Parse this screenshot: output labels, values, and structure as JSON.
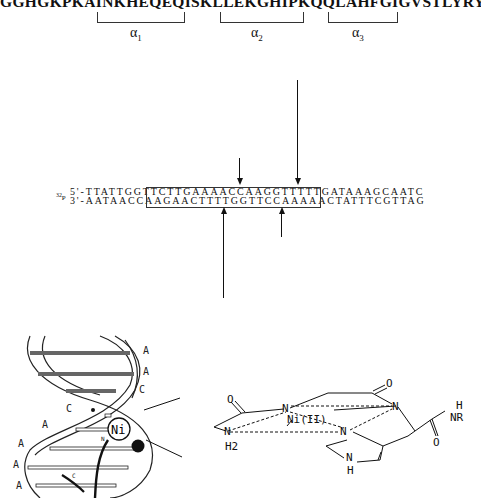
{
  "protein": {
    "sequence": "GGHGKPKAINKHEQEQISKLLEKGHIPKQQLAHFGIGVSTLYRYFPASSIKKRMN",
    "helices": [
      {
        "symbol": "α",
        "index": "1"
      },
      {
        "symbol": "α",
        "index": "2"
      },
      {
        "symbol": "α",
        "index": "3"
      }
    ]
  },
  "dna": {
    "label": "32P",
    "top_prefix": "5'-",
    "top_left": "TTATTGG",
    "top_boxed": "TTCTTGAAAACCAAGGTTTTTGATAA",
    "top_right": "AGCAATC",
    "bottom_prefix": "3'-",
    "bottom_left": "AATAACC",
    "bottom_boxed": "AAGAACTTTTGGTTCCAAAAACTATT",
    "bottom_right": "TCGTTAG"
  },
  "helix_diagram": {
    "bases_right": [
      "A",
      "A",
      "C"
    ],
    "bases_left": [
      "C",
      "A",
      "A",
      "A",
      "A"
    ],
    "minor_label": "C",
    "metal_label": "Ni",
    "n_label": "N"
  },
  "structure": {
    "metal": "Ni(II)",
    "atoms": [
      "N",
      "N",
      "N",
      "N"
    ],
    "amine": "N",
    "amine_sub": "H2",
    "imidazole_nh": "N",
    "imidazole_h": "H",
    "amide_h": "H",
    "amide_nr": "NR",
    "oxygens": [
      "O",
      "O",
      "O"
    ]
  }
}
